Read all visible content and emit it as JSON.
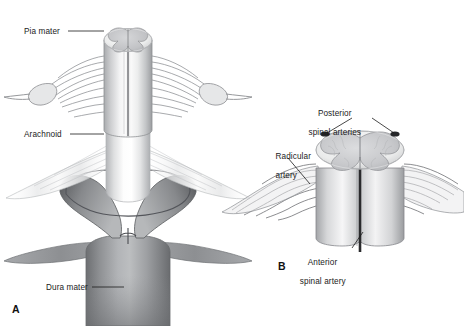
{
  "figure": {
    "background_color": "#ffffff",
    "ink_color": "#1b1b1b",
    "style": "grayscale medical line illustration with airbrush shading"
  },
  "panels": [
    {
      "id": "A",
      "marker": "A",
      "subject": "Meningeal coverings of the spinal cord",
      "labels": [
        {
          "name": "pia-mater",
          "text": "Pia mater",
          "leader": "horizontal line to cord surface at top"
        },
        {
          "name": "arachnoid",
          "text": "Arachnoid",
          "leader": "horizontal line to translucent membrane"
        },
        {
          "name": "dura-mater",
          "text": "Dura mater",
          "leader": "horizontal line to dark outer sleeve"
        }
      ]
    },
    {
      "id": "B",
      "marker": "B",
      "subject": "Arterial supply of the spinal cord",
      "labels": [
        {
          "name": "posterior-spinal-arteries",
          "text_line1": "Posterior",
          "text_line2": "spinal arteries",
          "leader": "two lines splitting to posterolateral cord margins"
        },
        {
          "name": "radicular-artery",
          "text_line1": "Radicular",
          "text_line2": "artery",
          "leader": "diagonal line to lateral vessel"
        },
        {
          "name": "anterior-spinal-artery",
          "text_line1": "Anterior",
          "text_line2": "spinal artery",
          "leader": "diagonal line up to midline vessel"
        }
      ]
    }
  ],
  "colors": {
    "ink": "#1b1b1b",
    "stroke_mid": "#6f7176",
    "stroke_light": "#9a9ca1",
    "gray_matter": "#c9cacc",
    "white_matter_light": "#f2f2f3",
    "cord_mid": "#b9babd",
    "dura_dark": "#8b8d90",
    "dura_darker": "#6e7073",
    "artery_dark": "#2a2b2d",
    "background": "#ffffff"
  }
}
